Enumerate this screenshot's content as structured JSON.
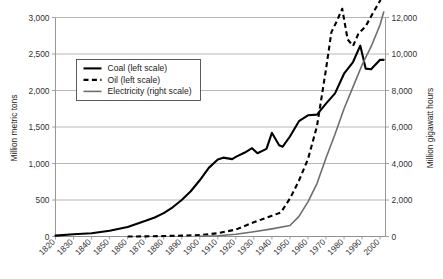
{
  "chart_data": {
    "type": "line",
    "title": "",
    "xlabel": "",
    "ylabel": "Million metric tons",
    "y2label": "Million gigawatt hours",
    "grid": true,
    "legend_position": "upper-left-inside",
    "x": [
      1820,
      1830,
      1840,
      1850,
      1860,
      1870,
      1880,
      1890,
      1900,
      1910,
      1920,
      1930,
      1940,
      1950,
      1960,
      1970,
      1980,
      1990,
      2000
    ],
    "xtick_labels": [
      "1820",
      "1830",
      "1840",
      "1850",
      "1860",
      "1870",
      "1880",
      "1890",
      "1900",
      "1910",
      "1920",
      "1930",
      "1940",
      "1950",
      "1960",
      "1970",
      "1980",
      "1990",
      "2000"
    ],
    "xlim": [
      1820,
      2003
    ],
    "ylim": [
      0,
      3000
    ],
    "ytick_labels": [
      "0",
      "500",
      "1,000",
      "1,500",
      "2,000",
      "2,500",
      "3,000"
    ],
    "ytick_values": [
      0,
      500,
      1000,
      1500,
      2000,
      2500,
      3000
    ],
    "y2lim": [
      0,
      12000
    ],
    "y2tick_labels": [
      "0",
      "2,000",
      "4,000",
      "6,000",
      "8,000",
      "10,000",
      "12,000"
    ],
    "y2tick_values": [
      0,
      2000,
      4000,
      6000,
      8000,
      10000,
      12000
    ],
    "series": [
      {
        "name": "Coal (left scale)",
        "axis": "left",
        "style": "solid",
        "color": "#000000",
        "x": [
          1820,
          1830,
          1840,
          1850,
          1860,
          1870,
          1875,
          1880,
          1885,
          1890,
          1895,
          1900,
          1905,
          1910,
          1913,
          1918,
          1920,
          1925,
          1929,
          1932,
          1937,
          1940,
          1944,
          1946,
          1950,
          1955,
          1960,
          1965,
          1970,
          1975,
          1980,
          1985,
          1989,
          1992,
          1995,
          2000,
          2002
        ],
        "values": [
          12,
          30,
          45,
          78,
          130,
          215,
          260,
          320,
          400,
          500,
          620,
          770,
          940,
          1055,
          1080,
          1060,
          1090,
          1150,
          1210,
          1140,
          1200,
          1420,
          1250,
          1230,
          1370,
          1580,
          1660,
          1670,
          1820,
          1960,
          2230,
          2390,
          2615,
          2300,
          2290,
          2420,
          2420
        ]
      },
      {
        "name": "Oil (left scale)",
        "axis": "left",
        "style": "dashed",
        "color": "#000000",
        "x": [
          1860,
          1870,
          1880,
          1890,
          1900,
          1910,
          1920,
          1930,
          1940,
          1945,
          1950,
          1955,
          1960,
          1965,
          1970,
          1973,
          1976,
          1979,
          1982,
          1985,
          1988,
          1992,
          1996,
          2000,
          2002
        ],
        "values": [
          0,
          2,
          6,
          12,
          20,
          45,
          95,
          195,
          285,
          330,
          520,
          765,
          1060,
          1510,
          2290,
          2800,
          2950,
          3120,
          2700,
          2610,
          2780,
          2880,
          3060,
          3230,
          3350
        ]
      },
      {
        "name": "Electricity (right scale)",
        "axis": "right",
        "style": "solid",
        "color": "#6e6e6e",
        "x": [
          1900,
          1910,
          1920,
          1930,
          1940,
          1950,
          1955,
          1960,
          1965,
          1970,
          1975,
          1980,
          1985,
          1990,
          1995,
          2000,
          2002
        ],
        "values": [
          10,
          40,
          120,
          260,
          420,
          600,
          1100,
          1900,
          2900,
          4300,
          5600,
          7000,
          8200,
          9400,
          10400,
          11600,
          12300
        ]
      }
    ],
    "legend": [
      {
        "label": "Coal (left scale)",
        "style": "solid",
        "color": "#000000"
      },
      {
        "label": "Oil (left scale)",
        "style": "dashed",
        "color": "#000000"
      },
      {
        "label": "Electricity (right scale)",
        "style": "solid",
        "color": "#6e6e6e"
      }
    ]
  },
  "axes": {
    "left_title": "Million metric tons",
    "right_title": "Million gigawatt hours"
  },
  "caption": {
    "text": ""
  },
  "colors": {
    "grid": "#9a9a9a",
    "axis": "#8c8c8c",
    "coal": "#000000",
    "oil": "#000000",
    "electricity": "#6e6e6e",
    "text": "#333333"
  }
}
